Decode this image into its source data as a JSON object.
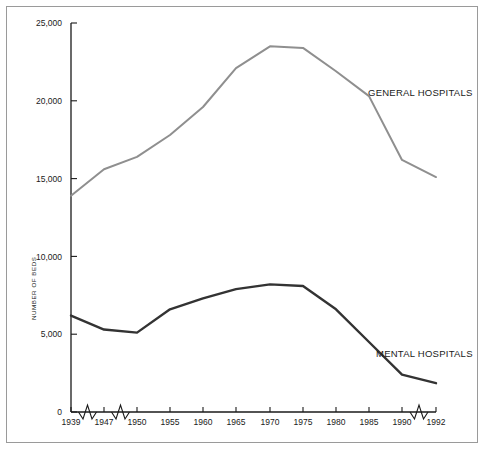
{
  "chart_data": {
    "type": "line",
    "title": "",
    "subtitle": "",
    "xlabel": "",
    "ylabel": "NUMBER OF BEDS",
    "ylim": [
      0,
      25000
    ],
    "ytick_labels": [
      "0",
      "5,000",
      "10,000",
      "15,000",
      "20,000",
      "25,000"
    ],
    "ytick_values": [
      0,
      5000,
      10000,
      15000,
      20000,
      25000
    ],
    "grid": false,
    "legend_position": "inline-annotation",
    "axis_breaks": [
      "1939-1947",
      "1947-1950",
      "1990-1992"
    ],
    "categories": [
      "1939",
      "1947",
      "1950",
      "1955",
      "1960",
      "1965",
      "1970",
      "1975",
      "1980",
      "1985",
      "1990",
      "1992"
    ],
    "x": [
      1939,
      1947,
      1950,
      1955,
      1960,
      1965,
      1970,
      1975,
      1980,
      1985,
      1990,
      1992
    ],
    "series": [
      {
        "name": "GENERAL HOSPITALS",
        "color": "#8f8f8f",
        "values": [
          13900,
          15600,
          16400,
          17800,
          19600,
          22100,
          23500,
          23400,
          21900,
          20300,
          16200,
          15100
        ]
      },
      {
        "name": "MENTAL HOSPITALS",
        "color": "#333333",
        "values": [
          6200,
          5300,
          5100,
          6600,
          7300,
          7900,
          8200,
          8100,
          6600,
          4500,
          2400,
          1850
        ]
      }
    ],
    "annotations": [
      {
        "text": "GENERAL HOSPITALS",
        "x_px": 368,
        "y_px": 96
      },
      {
        "text": "MENTAL HOSPITALS",
        "x_px": 376,
        "y_px": 357
      }
    ]
  },
  "axis": {
    "origin_px": {
      "x": 71,
      "y": 412
    },
    "top_px": 23,
    "right_px": 436,
    "tick_px": [
      71,
      104,
      137,
      170,
      203,
      236,
      270,
      303,
      336,
      369,
      402,
      436
    ]
  }
}
